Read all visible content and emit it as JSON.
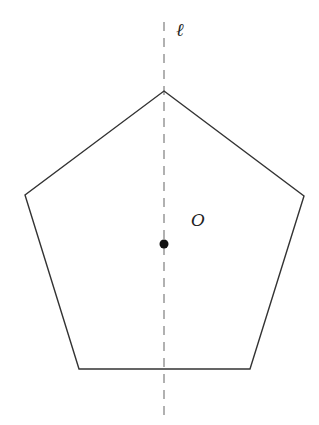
{
  "diagram": {
    "type": "geometry",
    "shape": "regular pentagon",
    "vertices": [
      [
        164,
        91
      ],
      [
        304,
        196
      ],
      [
        250,
        369
      ],
      [
        79,
        369
      ],
      [
        25,
        195
      ]
    ],
    "center": {
      "label": "O",
      "x": 164,
      "y": 244
    },
    "axis_line": {
      "label": "ℓ",
      "x": 164,
      "y1": 22,
      "y2": 418,
      "style": "dashed"
    },
    "labels": {
      "line": "ℓ",
      "center": "O"
    },
    "colors": {
      "stroke": "#333333",
      "axis": "#888888",
      "point": "#111111"
    }
  }
}
